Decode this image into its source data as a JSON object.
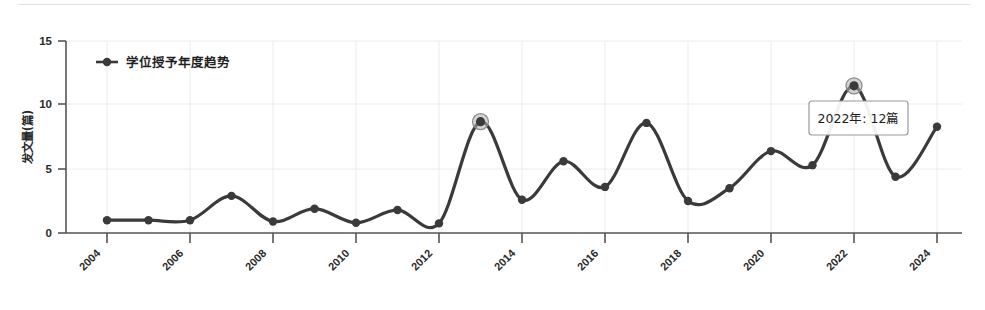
{
  "chart_data": {
    "type": "line",
    "title": "",
    "xlabel": "",
    "ylabel": "发文量(篇)",
    "legend": [
      "学位授予年度趋势"
    ],
    "legend_position": "top-left",
    "grid": true,
    "xlim": [
      2004,
      2024
    ],
    "ylim": [
      0,
      15
    ],
    "yticks": [
      0,
      5,
      10,
      15
    ],
    "ytick_labels": [
      "0",
      "5",
      "10",
      "15"
    ],
    "xticks": [
      2004,
      2006,
      2008,
      2010,
      2012,
      2014,
      2016,
      2018,
      2020,
      2022,
      2024
    ],
    "xtick_labels": [
      "2004",
      "2006",
      "2008",
      "2010",
      "2012",
      "2014",
      "2016",
      "2018",
      "2020",
      "2022",
      "2024"
    ],
    "x": [
      2004,
      2005,
      2006,
      2007,
      2008,
      2009,
      2010,
      2011,
      2012,
      2013,
      2014,
      2015,
      2016,
      2017,
      2018,
      2019,
      2020,
      2021,
      2022,
      2023,
      2024
    ],
    "values": [
      1.0,
      1.0,
      1.0,
      2.9,
      0.9,
      1.9,
      0.8,
      1.8,
      0.75,
      8.7,
      2.6,
      5.6,
      3.6,
      8.6,
      2.5,
      3.5,
      6.4,
      5.3,
      11.5,
      4.4,
      8.3
    ],
    "series": [
      {
        "name": "学位授予年度趋势",
        "values": [
          1.0,
          1.0,
          1.0,
          2.9,
          0.9,
          1.9,
          0.8,
          1.8,
          0.75,
          8.7,
          2.6,
          5.6,
          3.6,
          8.6,
          2.5,
          3.5,
          6.4,
          5.3,
          11.5,
          4.4,
          8.3
        ]
      }
    ],
    "highlighted_points": [
      {
        "x": 2013,
        "y": 8.7
      },
      {
        "x": 2022,
        "y": 11.5
      }
    ],
    "annotations": [
      {
        "text": "2022年: 12篇",
        "x": 2022,
        "y": 11.5
      }
    ],
    "line_color": "#3a3a3a",
    "marker_color": "#3a3a3a",
    "highlight_color": "#b0b0b0",
    "grid_color": "#ececec",
    "axis_color": "#555555",
    "background": "#ffffff"
  },
  "tooltip": {
    "label": "2022年: 12篇"
  },
  "legend": {
    "item_label": "学位授予年度趋势"
  },
  "axes": {
    "y_title": "发文量(篇)"
  }
}
